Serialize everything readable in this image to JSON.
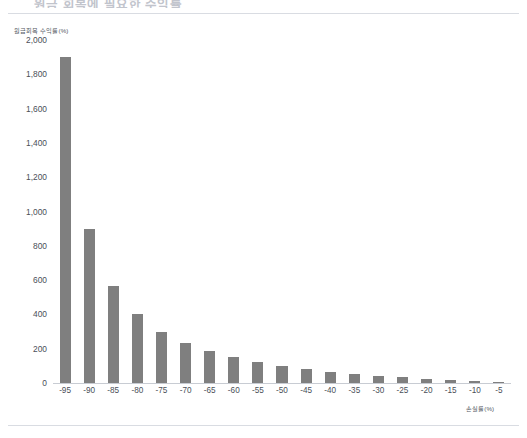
{
  "document": {
    "top_heading_partial": "원금 회복에 필요한 수익률",
    "divider_color": "#d9dce2"
  },
  "chart_data": {
    "type": "bar",
    "title": "",
    "subtitle": "",
    "xlabel": "손실률(%)",
    "ylabel": "원금회복 수익률(%)",
    "categories": [
      "-95",
      "-90",
      "-85",
      "-80",
      "-75",
      "-70",
      "-65",
      "-60",
      "-55",
      "-50",
      "-45",
      "-40",
      "-35",
      "-30",
      "-25",
      "-20",
      "-15",
      "-10",
      "-5"
    ],
    "values": [
      1900,
      900,
      567,
      400,
      300,
      233,
      186,
      150,
      122,
      100,
      82,
      67,
      54,
      43,
      33,
      25,
      18,
      11,
      5
    ],
    "series": [
      {
        "name": "원금회복 수익률(%)",
        "values": [
          1900,
          900,
          567,
          400,
          300,
          233,
          186,
          150,
          122,
          100,
          82,
          67,
          54,
          43,
          33,
          25,
          18,
          11,
          5
        ]
      }
    ],
    "ylim": [
      0,
      2000
    ],
    "yticks": [
      0,
      200,
      400,
      600,
      800,
      1000,
      1200,
      1400,
      1600,
      1800,
      2000
    ],
    "ytick_labels": [
      "0",
      "200",
      "400",
      "600",
      "800",
      "1,000",
      "1,200",
      "1,400",
      "1,600",
      "1,800",
      "2,000"
    ],
    "xtick_labels": [
      "-95",
      "-90",
      "-85",
      "-80",
      "-75",
      "-70",
      "-65",
      "-60",
      "-55",
      "-50",
      "-45",
      "-40",
      "-35",
      "-30",
      "-25",
      "-20",
      "-15",
      "-10",
      "-5"
    ],
    "grid": false,
    "legend": "none",
    "bar_color": "#7f7f7f",
    "axis_color": "#c8ccd3",
    "text_color": "#4a4f58",
    "background": "#ffffff"
  }
}
